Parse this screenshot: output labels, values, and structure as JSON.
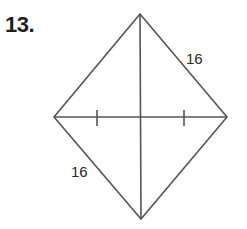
{
  "problem": {
    "number": "13."
  },
  "figure": {
    "shape": "rhombus-like quadrilateral with diagonals",
    "vertices": {
      "top": [
        140,
        14
      ],
      "left": [
        54,
        117
      ],
      "right": [
        227,
        117
      ],
      "bottom": [
        141,
        219
      ]
    },
    "labels": [
      {
        "text": "16",
        "side": "top-right",
        "x": 186,
        "y": 64
      },
      {
        "text": "16",
        "side": "bottom-left",
        "x": 71,
        "y": 177
      }
    ],
    "tick_marks": [
      {
        "x": 97
      },
      {
        "x": 184
      }
    ],
    "colors": {
      "stroke": "#555555",
      "text": "#2a2a2a"
    }
  }
}
